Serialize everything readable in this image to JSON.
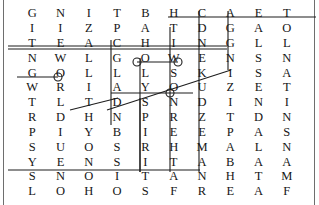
{
  "puzzle": {
    "kind": "word-search-grid",
    "rows": 13,
    "cols": 10,
    "letter_color": "#161616",
    "line_color": "#1d1d1d",
    "background": "#ffffff",
    "grid": [
      [
        "G",
        "N",
        "I",
        "T",
        "B",
        "H",
        "C",
        "A",
        "E",
        "T"
      ],
      [
        "I",
        "I",
        "Z",
        "P",
        "A",
        "T",
        "D",
        "G",
        "A",
        "O"
      ],
      [
        "T",
        "E",
        "A",
        "C",
        "H",
        "I",
        "N",
        "G",
        "L",
        "L"
      ],
      [
        "N",
        "W",
        "L",
        "G",
        "O",
        "W",
        "E",
        "N",
        "S",
        "N"
      ],
      [
        "G",
        "O",
        "L",
        "L",
        "L",
        "S",
        "K",
        "I",
        "S",
        "A"
      ],
      [
        "W",
        "R",
        "I",
        "A",
        "Y",
        "O",
        "U",
        "Z",
        "E",
        "T"
      ],
      [
        "T",
        "L",
        "T",
        "D",
        "S",
        "N",
        "D",
        "I",
        "N",
        "I"
      ],
      [
        "R",
        "D",
        "H",
        "N",
        "P",
        "R",
        "Z",
        "T",
        "D",
        "N"
      ],
      [
        "P",
        "I",
        "Y",
        "B",
        "I",
        "E",
        "E",
        "P",
        "A",
        "S"
      ],
      [
        "S",
        "U",
        "O",
        "S",
        "R",
        "H",
        "M",
        "A",
        "L",
        "N"
      ],
      [
        "Y",
        "E",
        "N",
        "S",
        "I",
        "T",
        "A",
        "B",
        "A",
        "A"
      ],
      [
        "S",
        "N",
        "O",
        "I",
        "T",
        "A",
        "N",
        "H",
        "T",
        "M"
      ],
      [
        "L",
        "O",
        "H",
        "O",
        "S",
        "F",
        "R",
        "E",
        "A",
        "F"
      ]
    ],
    "marks": [
      {
        "id": "mark-row1-horizontal",
        "label": "HCAET",
        "kind": "horizontal-strike"
      },
      {
        "id": "mark-row3-horizontal",
        "label": "TEACHING",
        "kind": "horizontal-strike"
      },
      {
        "id": "mark-row4-horizontal",
        "label": "GO",
        "kind": "horizontal-strike"
      },
      {
        "id": "mark-row5-horizontal",
        "label": "GO",
        "kind": "horizontal-strike"
      },
      {
        "id": "mark-row6-horizontal",
        "label": "YOU",
        "kind": "horizontal-strike"
      },
      {
        "id": "mark-row12-horizontal",
        "label": "SNOITAN",
        "kind": "horizontal-strike"
      },
      {
        "id": "mark-col6-vertical",
        "label": "ITWSONREHTAF",
        "kind": "vertical-strike"
      },
      {
        "id": "mark-col7-vertical",
        "label": "DNEKUDZEMANR",
        "kind": "vertical-strike"
      },
      {
        "id": "mark-col8-vertical",
        "label": "AGLNISZTPAHE",
        "kind": "vertical-strike"
      },
      {
        "id": "mark-col4-vertical",
        "label": "TPCGLADNBSIO",
        "kind": "vertical-strike"
      },
      {
        "id": "mark-col5-vertical",
        "label": "BAHOLYSPIRIT",
        "kind": "vertical-strike"
      },
      {
        "id": "mark-diagonal",
        "label": "diagonal-strike",
        "kind": "diagonal-strike"
      }
    ]
  }
}
